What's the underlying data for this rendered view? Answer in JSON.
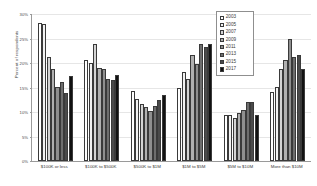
{
  "chart_data": {
    "type": "bar",
    "title": "",
    "xlabel": "",
    "ylabel": "Percent of respondents",
    "ylim": [
      0,
      30
    ],
    "ytick_labels": [
      "0%",
      "5%",
      "10%",
      "15%",
      "20%",
      "25%",
      "30%"
    ],
    "ytick_values": [
      0,
      5,
      10,
      15,
      20,
      25,
      30
    ],
    "grid": true,
    "legend_position": "top-right",
    "categories": [
      "$100K or less",
      "$100K to $500K",
      "$500K to $1M",
      "$1M to $5M",
      "$5M to $10M",
      "More than $10M"
    ],
    "series": [
      {
        "name": "2003",
        "color": "#ffffff",
        "values": [
          28.2,
          20.7,
          14.3,
          14.9,
          9.3,
          14.0
        ]
      },
      {
        "name": "2005",
        "color": "#f2f2f2",
        "values": [
          28.0,
          20.1,
          12.6,
          18.2,
          9.3,
          15.2
        ]
      },
      {
        "name": "2007",
        "color": "#d4d4d4",
        "values": [
          21.2,
          23.9,
          11.6,
          16.8,
          8.7,
          18.7
        ]
      },
      {
        "name": "2009",
        "color": "#b0b0b0",
        "values": [
          18.7,
          19.0,
          11.1,
          21.6,
          9.9,
          20.7
        ]
      },
      {
        "name": "2011",
        "color": "#8f8f8f",
        "values": [
          15.2,
          18.8,
          10.2,
          19.8,
          10.5,
          24.8
        ]
      },
      {
        "name": "2013",
        "color": "#6e6e6e",
        "values": [
          16.1,
          16.8,
          11.3,
          23.9,
          12.0,
          21.2
        ]
      },
      {
        "name": "2015",
        "color": "#4a4a4a",
        "values": [
          13.9,
          16.6,
          12.5,
          23.3,
          12.0,
          21.6
        ]
      },
      {
        "name": "2017",
        "color": "#111111",
        "values": [
          17.3,
          17.6,
          13.5,
          23.9,
          9.4,
          18.7
        ]
      }
    ]
  }
}
